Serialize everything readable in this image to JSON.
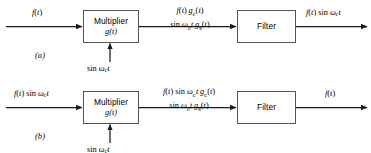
{
  "figure": {
    "background_color": "#ffffff",
    "line_color": "#1a1a1a",
    "box_border_color": "#555555",
    "panels": [
      {
        "id": "a",
        "panel_label": "(a)",
        "input_label_html": "<i>f</i>(<i>t</i>)",
        "input_label_text": "f(t)",
        "carrier_label_text": "sin ωc t",
        "blocks": [
          {
            "name": "multiplier",
            "title": "Multiplier",
            "subtitle": "g(t)"
          },
          {
            "name": "filter",
            "title": "Filter",
            "subtitle": ""
          }
        ],
        "middle_label_top": "f(t) gc(t)",
        "middle_label_bottom": "sin ωc t gs(t)",
        "output_label_text": "f(t) sin ωc t"
      },
      {
        "id": "b",
        "panel_label": "(b)",
        "input_label_text": "f(t) sin ωc t",
        "carrier_label_text": "sin ωc t",
        "blocks": [
          {
            "name": "multiplier",
            "title": "Multiplier",
            "subtitle": "g(t)"
          },
          {
            "name": "filter",
            "title": "Filter",
            "subtitle": ""
          }
        ],
        "middle_label_top": "f(t) sin ωc t gc(t)",
        "middle_label_bottom": "sin ωc t gs(t)",
        "output_label_text": "f(t)"
      }
    ]
  }
}
